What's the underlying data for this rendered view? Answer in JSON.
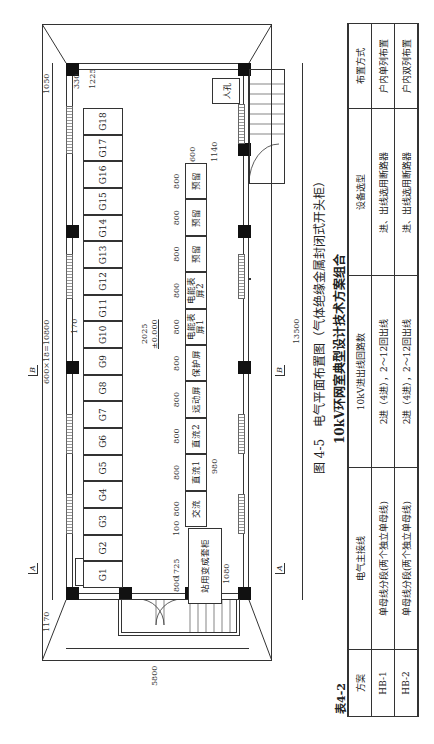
{
  "figure": {
    "caption": "图 4-5　电气平面布置图（气体绝缘金属封闭式开头柜）",
    "table_caption": "10kV环网室典型设计技术方案组合",
    "table_number": "表4-2"
  },
  "plan": {
    "main_cabinets": [
      "G1",
      "G2",
      "G3",
      "G4",
      "G5",
      "G6",
      "G7",
      "G8",
      "G9",
      "G10",
      "G11",
      "G12",
      "G13",
      "G14",
      "G15",
      "G16",
      "G17",
      "G18"
    ],
    "secondary_cabinets": [
      "交流",
      "直流1",
      "直流2",
      "远动屏",
      "保护屏",
      "电能表屏1",
      "电能表屏2",
      "预留",
      "预留",
      "预留"
    ],
    "station_transformer": "站用变成套柜",
    "manhole_label": "人孔",
    "elevation": "±0.000",
    "section_marks": [
      "A",
      "A",
      "B",
      "B"
    ],
    "dimensions": {
      "total_length": "13500",
      "cabinet_row": "600×18=10800",
      "left_end": "1170",
      "right_end": "1050",
      "width": "5800",
      "d330": "330",
      "d1225": "1225",
      "d170": "170",
      "d2025": "2025",
      "d980": "980",
      "d600": "600",
      "d1140": "1140",
      "d1725": "1725",
      "d100": "100",
      "d800": "800",
      "d1080": "1080",
      "cab_widths": [
        "800",
        "800",
        "800",
        "800",
        "800",
        "800",
        "800",
        "800",
        "800",
        "800"
      ]
    }
  },
  "table": {
    "headers": [
      "方案",
      "电气主接线",
      "10kV进出线回路数",
      "设备选型",
      "布置方式"
    ],
    "rows": [
      [
        "HB-1",
        "单母线分段(两个独立单母线)",
        "2进（4进），2～12回出线",
        "进、出线选用断路器",
        "户内单列布置"
      ],
      [
        "HB-2",
        "单母线分段(两个独立单母线)",
        "2进（4进），2～12回出线",
        "进、出线选用断路器",
        "户内双列布置"
      ]
    ]
  }
}
